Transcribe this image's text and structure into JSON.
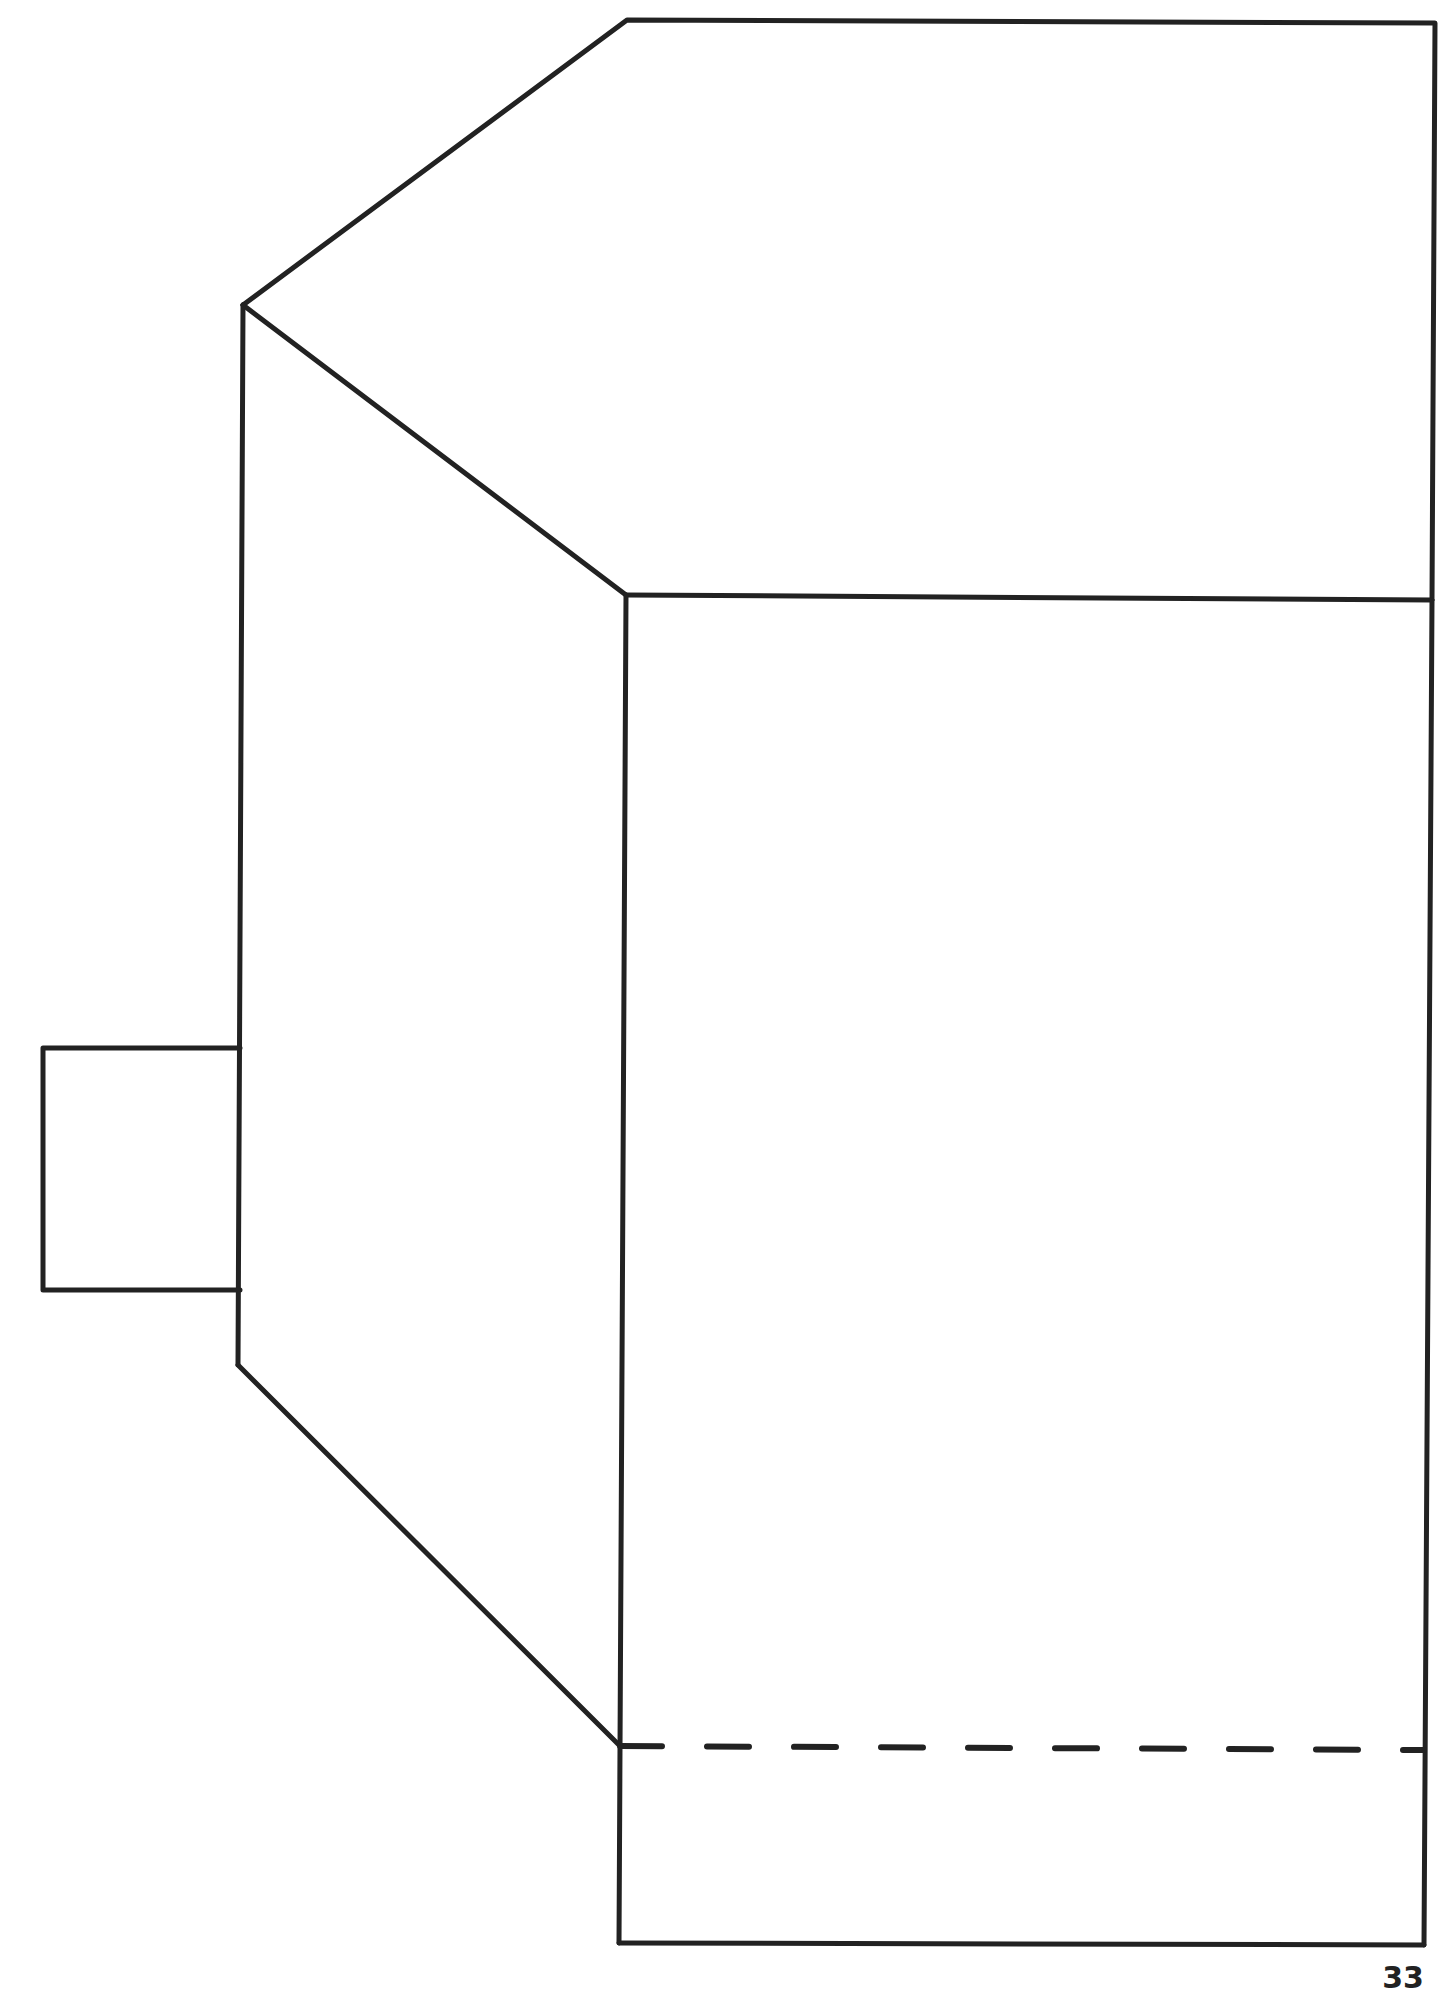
{
  "page": {
    "number": "33",
    "stroke_color": "#222222",
    "background": "#ffffff"
  },
  "diagram": {
    "type": "line-drawing",
    "elements": [
      {
        "name": "top-face",
        "points": [
          [
            243,
            305
          ],
          [
            627,
            20
          ],
          [
            1435,
            23
          ],
          [
            1432,
            600
          ],
          [
            626,
            595
          ]
        ]
      },
      {
        "name": "side-face",
        "points": [
          [
            243,
            305
          ],
          [
            626,
            595
          ],
          [
            620,
            1746
          ],
          [
            238,
            1365
          ]
        ]
      },
      {
        "name": "front-face",
        "points": [
          [
            626,
            595
          ],
          [
            1432,
            600
          ],
          [
            1424,
            1945
          ],
          [
            619,
            1943
          ]
        ]
      },
      {
        "name": "left-tab",
        "points": [
          [
            43,
            1048
          ],
          [
            240,
            1048
          ],
          [
            240,
            1290
          ],
          [
            43,
            1290
          ]
        ]
      },
      {
        "name": "dashed-fold-line",
        "from": [
          620,
          1746
        ],
        "to": [
          1424,
          1750
        ],
        "dashed": true
      }
    ]
  }
}
